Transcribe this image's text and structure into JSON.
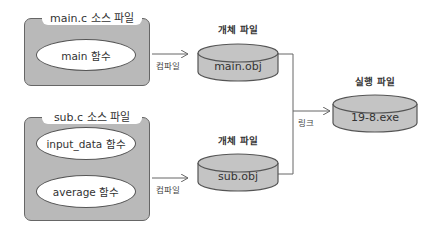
{
  "source_files": [
    {
      "title": "main.c 소스 파일",
      "functions": [
        "main 함수"
      ]
    },
    {
      "title": "sub.c 소스 파일",
      "functions": [
        "input_data 함수",
        "average 함수"
      ]
    }
  ],
  "compile_label": "컴파일",
  "object_files": [
    {
      "heading": "개체 파일",
      "name": "main.obj"
    },
    {
      "heading": "개체 파일",
      "name": "sub.obj"
    }
  ],
  "link_label": "링크",
  "executable": {
    "heading": "실행 파일",
    "name": "19-8.exe"
  },
  "colors": {
    "box_fill": "#b9b9b9",
    "cylinder_fill": "#c4c4c4",
    "stroke": "#555555"
  }
}
